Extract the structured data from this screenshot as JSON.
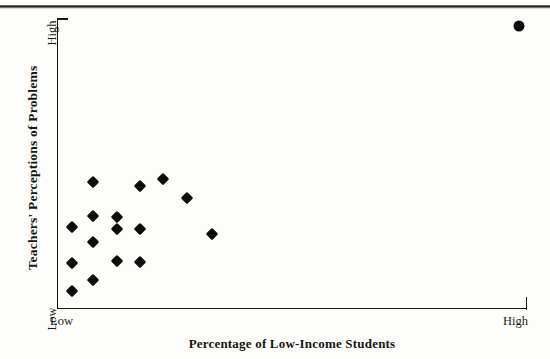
{
  "figure": {
    "background_color": "#fdfdfb",
    "ink_color": "#17170f"
  },
  "chart_data": {
    "type": "scatter",
    "title": "",
    "xlabel": "Percentage of Low-Income Students",
    "ylabel": "Teachers' Perceptions of Problems",
    "xlim": [
      0,
      100
    ],
    "ylim": [
      0,
      100
    ],
    "grid": false,
    "legend": null,
    "x_tick_labels": [
      "Low",
      "High"
    ],
    "y_tick_labels": [
      "Low",
      "High"
    ],
    "series": [
      {
        "name": "schools",
        "marker": "diamond",
        "color": "#0c0c0a",
        "points": [
          {
            "px": 72,
            "py": 227,
            "x": 3,
            "y": 28
          },
          {
            "px": 72,
            "py": 263,
            "x": 3,
            "y": 16
          },
          {
            "px": 72,
            "py": 291,
            "x": 3,
            "y": 6
          },
          {
            "px": 93,
            "py": 182,
            "x": 8,
            "y": 44
          },
          {
            "px": 93,
            "py": 216,
            "x": 8,
            "y": 32
          },
          {
            "px": 93,
            "py": 242,
            "x": 8,
            "y": 23
          },
          {
            "px": 93,
            "py": 280,
            "x": 8,
            "y": 10
          },
          {
            "px": 117,
            "py": 217,
            "x": 13,
            "y": 32
          },
          {
            "px": 117,
            "py": 229,
            "x": 13,
            "y": 28
          },
          {
            "px": 117,
            "py": 261,
            "x": 13,
            "y": 17
          },
          {
            "px": 140,
            "py": 186,
            "x": 18,
            "y": 42
          },
          {
            "px": 140,
            "py": 229,
            "x": 18,
            "y": 28
          },
          {
            "px": 140,
            "py": 262,
            "x": 18,
            "y": 16
          },
          {
            "px": 163,
            "py": 179,
            "x": 23,
            "y": 45
          },
          {
            "px": 187,
            "py": 198,
            "x": 28,
            "y": 38
          },
          {
            "px": 212,
            "py": 234,
            "x": 33,
            "y": 26
          }
        ]
      },
      {
        "name": "outlier",
        "marker": "circle",
        "color": "#0c0c0a",
        "points": [
          {
            "px": 519,
            "py": 26,
            "x": 98,
            "y": 98
          }
        ]
      }
    ]
  },
  "axes": {
    "y_title": "Teachers' Perceptions of Problems",
    "x_title": "Percentage of Low-Income Students",
    "y_high_label": "High",
    "y_low_label": "Low",
    "x_low_label": "Low",
    "x_high_label": "High"
  },
  "artifacts": {
    "bottom_ghost_text": ""
  }
}
